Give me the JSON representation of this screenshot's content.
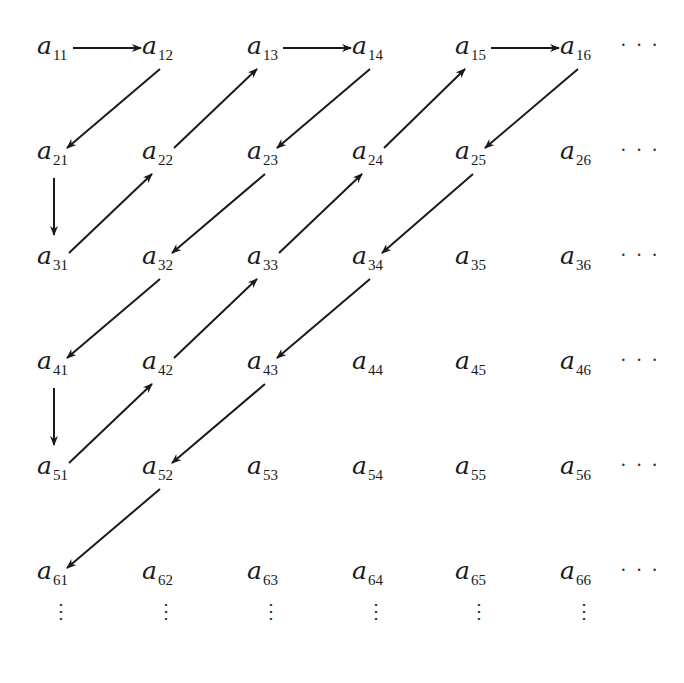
{
  "diagram": {
    "title": "",
    "symbol": "a",
    "rows": [
      [
        "11",
        "12",
        "13",
        "14",
        "15",
        "16"
      ],
      [
        "21",
        "22",
        "23",
        "24",
        "25",
        "26"
      ],
      [
        "31",
        "32",
        "33",
        "34",
        "35",
        "36"
      ],
      [
        "41",
        "42",
        "43",
        "44",
        "45",
        "46"
      ],
      [
        "51",
        "52",
        "53",
        "54",
        "55",
        "56"
      ],
      [
        "61",
        "62",
        "63",
        "64",
        "65",
        "66"
      ]
    ],
    "row_continuation": "· · ·",
    "column_continuation": "⋮",
    "arrow_color": "#1a1a1a",
    "path": [
      "11",
      "12",
      "21",
      "31",
      "22",
      "13",
      "14",
      "23",
      "32",
      "41",
      "51",
      "42",
      "33",
      "24",
      "15",
      "16",
      "25",
      "34",
      "43",
      "52",
      "61"
    ]
  }
}
